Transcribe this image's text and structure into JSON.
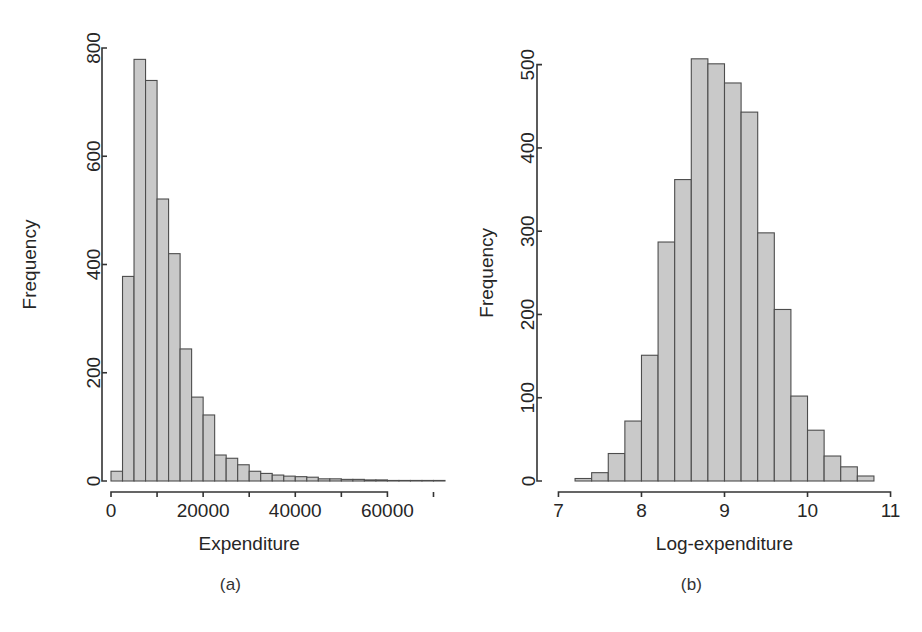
{
  "figure": {
    "background": "#ffffff",
    "bar_fill": "#c9c9c9",
    "bar_stroke": "#4d4d4d",
    "axis_color": "#333333"
  },
  "panels": [
    {
      "id": "a",
      "caption": "(a)",
      "ylabel": "Frequency",
      "xlabel": "Expenditure"
    },
    {
      "id": "b",
      "caption": "(b)",
      "ylabel": "Frequency",
      "xlabel": "Log-expenditure"
    }
  ],
  "chart_data": [
    {
      "type": "bar",
      "title": "",
      "subtitle": "",
      "panel": "(a)",
      "xlabel": "Expenditure",
      "ylabel": "Frequency",
      "xlim": [
        0,
        72500
      ],
      "ylim": [
        0,
        800
      ],
      "xticks": [
        0,
        20000,
        40000,
        60000
      ],
      "xticklabels": [
        "0",
        "20000",
        "40000",
        "60000"
      ],
      "yticks": [
        0,
        200,
        400,
        600,
        800
      ],
      "yticklabels": [
        "0",
        "200",
        "400",
        "600",
        "800"
      ],
      "grid": false,
      "legend": null,
      "bin_width": 2500,
      "bin_edges": [
        0,
        2500,
        5000,
        7500,
        10000,
        12500,
        15000,
        17500,
        20000,
        22500,
        25000,
        27500,
        30000,
        32500,
        35000,
        37500,
        40000,
        42500,
        45000,
        47500,
        50000,
        52500,
        55000,
        57500,
        60000,
        62500,
        65000,
        67500,
        70000,
        72500
      ],
      "categories": [
        "0-2500",
        "2500-5000",
        "5000-7500",
        "7500-10000",
        "10000-12500",
        "12500-15000",
        "15000-17500",
        "17500-20000",
        "20000-22500",
        "22500-25000",
        "25000-27500",
        "27500-30000",
        "30000-32500",
        "32500-35000",
        "35000-37500",
        "37500-40000",
        "40000-42500",
        "42500-45000",
        "45000-47500",
        "47500-50000",
        "50000-52500",
        "52500-55000",
        "55000-57500",
        "57500-60000",
        "60000-62500",
        "62500-65000",
        "65000-67500",
        "67500-70000",
        "70000-72500"
      ],
      "values": [
        18,
        378,
        779,
        740,
        521,
        420,
        244,
        155,
        122,
        48,
        42,
        30,
        18,
        14,
        11,
        9,
        8,
        7,
        4,
        4,
        3,
        3,
        2,
        2,
        1,
        1,
        1,
        1,
        1
      ]
    },
    {
      "type": "bar",
      "title": "",
      "subtitle": "",
      "panel": "(b)",
      "xlabel": "Log-expenditure",
      "ylabel": "Frequency",
      "xlim": [
        6.85,
        11.15
      ],
      "ylim": [
        0,
        520
      ],
      "xticks": [
        7,
        8,
        9,
        10,
        11
      ],
      "xticklabels": [
        "7",
        "8",
        "9",
        "10",
        "11"
      ],
      "yticks": [
        0,
        100,
        200,
        300,
        400,
        500
      ],
      "yticklabels": [
        "0",
        "100",
        "200",
        "300",
        "400",
        "500"
      ],
      "grid": false,
      "legend": null,
      "bin_width": 0.2,
      "bin_edges": [
        7.2,
        7.4,
        7.6,
        7.8,
        8.0,
        8.2,
        8.4,
        8.6,
        8.8,
        9.0,
        9.2,
        9.4,
        9.6,
        9.8,
        10.0,
        10.2,
        10.4,
        10.6,
        10.8
      ],
      "categories": [
        "7.2-7.4",
        "7.4-7.6",
        "7.6-7.8",
        "7.8-8.0",
        "8.0-8.2",
        "8.2-8.4",
        "8.4-8.6",
        "8.6-8.8",
        "8.8-9.0",
        "9.0-9.2",
        "9.2-9.4",
        "9.4-9.6",
        "9.6-9.8",
        "9.8-10.0",
        "10.0-10.2",
        "10.2-10.4",
        "10.4-10.6",
        "10.6-10.8"
      ],
      "values": [
        3,
        10,
        33,
        72,
        151,
        287,
        362,
        507,
        501,
        478,
        443,
        298,
        206,
        102,
        61,
        30,
        17,
        6
      ]
    }
  ]
}
